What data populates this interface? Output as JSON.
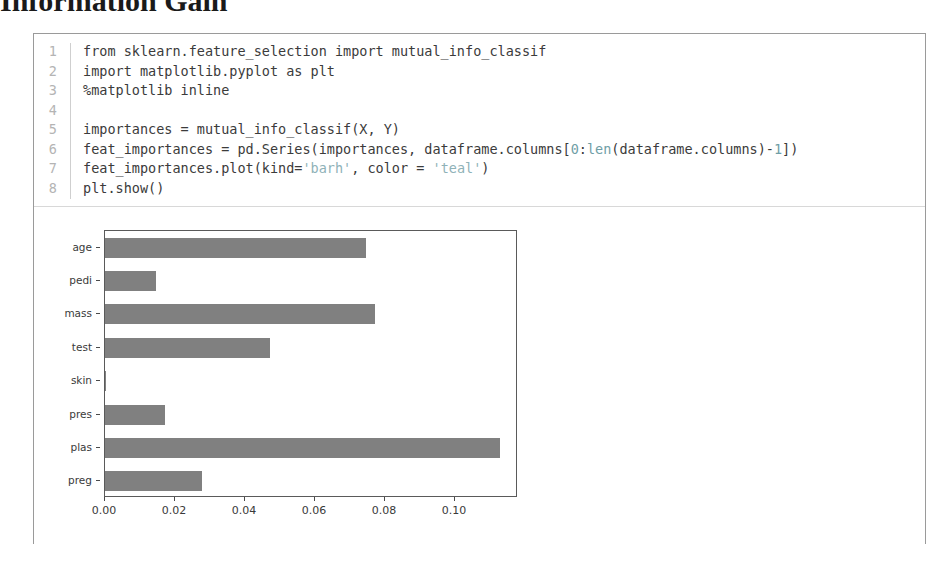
{
  "page": {
    "heading": "Information Gain"
  },
  "notebook": {
    "code": {
      "language": "python",
      "lines": [
        {
          "n": "1",
          "segments": [
            {
              "t": "from sklearn.feature_selection import mutual_info_classif",
              "k": "plain"
            }
          ]
        },
        {
          "n": "2",
          "segments": [
            {
              "t": "import matplotlib.pyplot as plt",
              "k": "plain"
            }
          ]
        },
        {
          "n": "3",
          "segments": [
            {
              "t": "%matplotlib inline",
              "k": "plain"
            }
          ]
        },
        {
          "n": "4",
          "segments": [
            {
              "t": "",
              "k": "plain"
            }
          ]
        },
        {
          "n": "5",
          "segments": [
            {
              "t": "importances = mutual_info_classif(X, Y)",
              "k": "plain"
            }
          ]
        },
        {
          "n": "6",
          "segments": [
            {
              "t": "feat_importances = pd.Series(importances, dataframe.columns[",
              "k": "plain"
            },
            {
              "t": "0",
              "k": "num"
            },
            {
              "t": ":",
              "k": "plain"
            },
            {
              "t": "len",
              "k": "num"
            },
            {
              "t": "(dataframe.columns)-",
              "k": "plain"
            },
            {
              "t": "1",
              "k": "num"
            },
            {
              "t": "])",
              "k": "plain"
            }
          ]
        },
        {
          "n": "7",
          "segments": [
            {
              "t": "feat_importances.plot(kind=",
              "k": "plain"
            },
            {
              "t": "'barh'",
              "k": "str"
            },
            {
              "t": ", color = ",
              "k": "plain"
            },
            {
              "t": "'teal'",
              "k": "str"
            },
            {
              "t": ")",
              "k": "plain"
            }
          ]
        },
        {
          "n": "8",
          "segments": [
            {
              "t": "plt.show()",
              "k": "plain"
            }
          ]
        }
      ]
    }
  },
  "chart_data": {
    "type": "bar",
    "orientation": "horizontal",
    "title": "",
    "xlabel": "",
    "ylabel": "",
    "categories": [
      "preg",
      "plas",
      "pres",
      "skin",
      "test",
      "mass",
      "pedi",
      "age"
    ],
    "values": [
      0.0277,
      0.1129,
      0.0171,
      0.0003,
      0.0471,
      0.0771,
      0.0146,
      0.0746
    ],
    "xlim": [
      0.0,
      0.118
    ],
    "xticks": [
      0.0,
      0.02,
      0.04,
      0.06,
      0.08,
      0.1
    ],
    "xtick_labels": [
      "0.00",
      "0.02",
      "0.04",
      "0.06",
      "0.08",
      "0.10"
    ],
    "bar_color": "#808080",
    "grid": false,
    "legend": null
  },
  "colors": {
    "bar": "#808080",
    "axis": "#5a5a5a",
    "cell_border": "#9a9a9a",
    "line_number": "#b4b4b4",
    "code_text": "#3b3b3b",
    "string_token": "#8fb2b8"
  }
}
